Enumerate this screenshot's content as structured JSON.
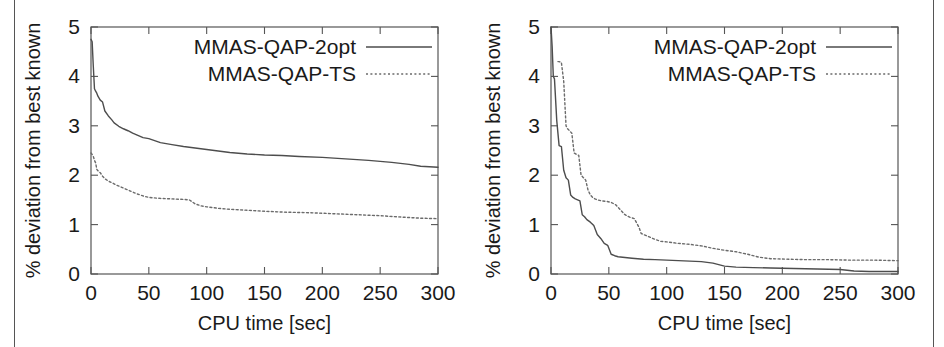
{
  "figure": {
    "background": "#ffffff",
    "border_color": "#555555",
    "series_colors": {
      "solid": "#4d4d4d",
      "dotted": "#6b6b6b"
    }
  },
  "panels": [
    {
      "id": "left-panel",
      "name": "qap-instance-left",
      "chart_data": {
        "type": "line",
        "title": "",
        "xlabel": "CPU time [sec]",
        "ylabel": "% deviation from best known",
        "xlim": [
          0,
          300
        ],
        "ylim": [
          0,
          5
        ],
        "xticks": [
          0,
          50,
          100,
          150,
          200,
          250,
          300
        ],
        "yticks": [
          0,
          1,
          2,
          3,
          4,
          5
        ],
        "grid": false,
        "legend_position": "top-right",
        "series": [
          {
            "name": "MMAS-QAP-2opt",
            "style": "solid",
            "x": [
              0,
              1,
              2,
              3,
              4,
              5,
              6,
              8,
              10,
              12,
              15,
              18,
              20,
              24,
              28,
              32,
              36,
              40,
              45,
              50,
              55,
              60,
              70,
              80,
              90,
              100,
              110,
              120,
              135,
              150,
              165,
              180,
              200,
              220,
              240,
              260,
              275,
              285,
              300
            ],
            "y": [
              4.75,
              4.7,
              4.2,
              3.75,
              3.7,
              3.66,
              3.6,
              3.52,
              3.48,
              3.3,
              3.2,
              3.12,
              3.06,
              2.99,
              2.94,
              2.9,
              2.85,
              2.81,
              2.76,
              2.74,
              2.7,
              2.66,
              2.62,
              2.58,
              2.55,
              2.52,
              2.49,
              2.46,
              2.43,
              2.41,
              2.4,
              2.38,
              2.36,
              2.33,
              2.3,
              2.26,
              2.22,
              2.18,
              2.16
            ]
          },
          {
            "name": "MMAS-QAP-TS",
            "style": "dotted",
            "x": [
              0,
              1,
              2,
              3,
              4,
              5,
              6,
              8,
              10,
              12,
              15,
              18,
              22,
              26,
              30,
              35,
              40,
              45,
              50,
              60,
              70,
              80,
              85,
              90,
              95,
              100,
              110,
              120,
              135,
              150,
              170,
              190,
              210,
              230,
              250,
              270,
              285,
              300
            ],
            "y": [
              2.45,
              2.42,
              2.38,
              2.3,
              2.25,
              2.12,
              2.09,
              2.05,
              1.98,
              1.93,
              1.88,
              1.85,
              1.8,
              1.76,
              1.72,
              1.67,
              1.62,
              1.58,
              1.55,
              1.53,
              1.52,
              1.51,
              1.5,
              1.42,
              1.38,
              1.36,
              1.33,
              1.31,
              1.29,
              1.27,
              1.25,
              1.24,
              1.22,
              1.2,
              1.18,
              1.15,
              1.13,
              1.12
            ]
          }
        ]
      }
    },
    {
      "id": "right-panel",
      "name": "qap-instance-right",
      "chart_data": {
        "type": "line",
        "title": "",
        "xlabel": "CPU time [sec]",
        "ylabel": "% deviation from best known",
        "xlim": [
          0,
          300
        ],
        "ylim": [
          0,
          5
        ],
        "xticks": [
          0,
          50,
          100,
          150,
          200,
          250,
          300
        ],
        "yticks": [
          0,
          1,
          2,
          3,
          4,
          5
        ],
        "grid": false,
        "legend_position": "top-right",
        "series": [
          {
            "name": "MMAS-QAP-2opt",
            "style": "solid",
            "x": [
              0,
              1,
              2,
              3,
              5,
              7,
              9,
              11,
              13,
              15,
              17,
              19,
              21,
              23,
              25,
              27,
              29,
              31,
              34,
              37,
              40,
              43,
              46,
              49,
              52,
              55,
              58,
              62,
              66,
              70,
              75,
              80,
              90,
              100,
              110,
              120,
              130,
              140,
              150,
              160,
              175,
              190,
              210,
              230,
              250,
              262,
              275,
              290,
              300
            ],
            "y": [
              5.0,
              4.6,
              4.0,
              3.95,
              3.1,
              2.6,
              2.58,
              2.1,
              1.95,
              1.9,
              1.6,
              1.55,
              1.52,
              1.5,
              1.48,
              1.2,
              1.16,
              1.1,
              1.05,
              0.98,
              0.8,
              0.72,
              0.62,
              0.58,
              0.4,
              0.37,
              0.35,
              0.34,
              0.33,
              0.32,
              0.31,
              0.3,
              0.29,
              0.28,
              0.27,
              0.26,
              0.25,
              0.22,
              0.16,
              0.14,
              0.13,
              0.12,
              0.11,
              0.1,
              0.09,
              0.06,
              0.05,
              0.05,
              0.05
            ]
          },
          {
            "name": "MMAS-QAP-TS",
            "style": "dotted",
            "x": [
              6,
              7,
              9,
              11,
              13,
              14,
              16,
              18,
              20,
              22,
              24,
              26,
              28,
              30,
              32,
              34,
              36,
              38,
              40,
              44,
              48,
              52,
              56,
              60,
              64,
              68,
              72,
              76,
              78,
              80,
              85,
              90,
              95,
              100,
              110,
              120,
              130,
              140,
              150,
              160,
              170,
              180,
              190,
              205,
              220,
              240,
              260,
              280,
              300
            ],
            "y": [
              4.3,
              4.3,
              4.28,
              3.9,
              3.0,
              2.95,
              2.9,
              2.85,
              2.45,
              2.42,
              2.4,
              2.0,
              1.95,
              1.9,
              1.7,
              1.6,
              1.55,
              1.52,
              1.5,
              1.48,
              1.47,
              1.45,
              1.4,
              1.3,
              1.2,
              1.15,
              1.12,
              0.95,
              0.82,
              0.8,
              0.75,
              0.7,
              0.66,
              0.65,
              0.62,
              0.6,
              0.57,
              0.52,
              0.48,
              0.45,
              0.4,
              0.34,
              0.31,
              0.3,
              0.29,
              0.29,
              0.28,
              0.28,
              0.27
            ]
          }
        ]
      }
    }
  ]
}
